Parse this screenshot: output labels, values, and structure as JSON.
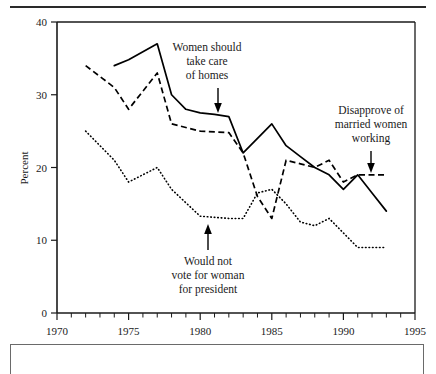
{
  "figure": {
    "has_top_rule": true,
    "has_bottom_caption_box": true
  },
  "chart_data": {
    "type": "line",
    "title": "",
    "xlabel": "",
    "ylabel": "Percent",
    "xlim": [
      1970,
      1995
    ],
    "ylim": [
      0,
      40
    ],
    "yticks": [
      0,
      10,
      20,
      30,
      40
    ],
    "ytick_labels": [
      "0",
      "10",
      "20",
      "30",
      "40"
    ],
    "xticks": [
      1970,
      1975,
      1980,
      1985,
      1990,
      1995
    ],
    "xtick_labels": [
      "1970",
      "1975",
      "1980",
      "1985",
      "1990",
      "1995"
    ],
    "xminor_step": 1,
    "grid": false,
    "legend": "annotations",
    "series": [
      {
        "name": "Women should take care of homes",
        "style": "solid",
        "x": [
          1974,
          1975,
          1977,
          1978,
          1979,
          1980,
          1981,
          1982,
          1983,
          1984,
          1985,
          1986,
          1987,
          1988,
          1989,
          1990,
          1991,
          1992,
          1993
        ],
        "values": [
          34,
          34.8,
          37,
          30,
          28,
          27.5,
          27.3,
          27,
          22,
          24,
          26,
          23,
          21.5,
          20,
          19,
          17,
          19,
          16.5,
          14
        ]
      },
      {
        "name": "Disapprove of married women working",
        "style": "dashed",
        "x": [
          1972,
          1974,
          1975,
          1977,
          1978,
          1980,
          1982,
          1983,
          1984,
          1985,
          1986,
          1987,
          1988,
          1989,
          1990,
          1991,
          1993
        ],
        "values": [
          34,
          31,
          28,
          33,
          26,
          25,
          24.8,
          22,
          16,
          13,
          21,
          20.5,
          20,
          21,
          18,
          19,
          19
        ]
      },
      {
        "name": "Would not vote for woman for president",
        "style": "dotted",
        "x": [
          1972,
          1974,
          1975,
          1977,
          1978,
          1980,
          1982,
          1983,
          1984,
          1985,
          1986,
          1987,
          1988,
          1989,
          1990,
          1991,
          1993
        ],
        "values": [
          25,
          21,
          18,
          20,
          17,
          13.3,
          13,
          13,
          16.5,
          17,
          15,
          12.5,
          12,
          13,
          11,
          9,
          9
        ]
      }
    ],
    "annotations": [
      {
        "id": "women-homes",
        "lines": [
          "Women should",
          "take care",
          "of homes"
        ],
        "arrow_direction": "down"
      },
      {
        "id": "disapprove-working",
        "lines": [
          "Disapprove of",
          "married women",
          "working"
        ],
        "arrow_direction": "down"
      },
      {
        "id": "would-not-vote",
        "lines": [
          "Would not",
          "vote for woman",
          "for president"
        ],
        "arrow_direction": "up"
      }
    ]
  }
}
